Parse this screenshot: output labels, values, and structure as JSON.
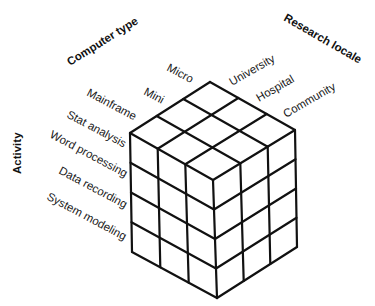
{
  "diagram": {
    "type": "3D classification cube (3 x 3 x 4 grid)",
    "axes": {
      "computer_type": {
        "title": "Computer type",
        "values": [
          "Micro",
          "Mini",
          "Mainframe"
        ]
      },
      "research_locale": {
        "title": "Research locale",
        "values": [
          "University",
          "Hospital",
          "Community"
        ]
      },
      "activity": {
        "title": "Activity",
        "values": [
          "Stat analysis",
          "Word processing",
          "Data recording",
          "System modeling"
        ]
      }
    },
    "colors": {
      "line": "#111111",
      "background": "#ffffff",
      "text": "#1a1a1a"
    }
  }
}
